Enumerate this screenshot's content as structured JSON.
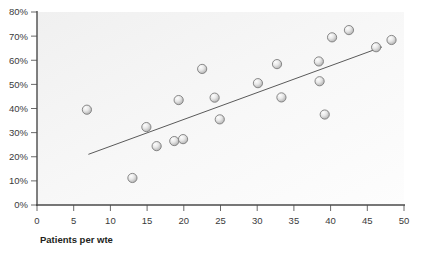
{
  "chart_data": {
    "type": "scatter",
    "title": "",
    "xlabel": "Patients per wte",
    "ylabel": "",
    "xlim": [
      0,
      50
    ],
    "ylim": [
      0,
      80
    ],
    "xticks": [
      0,
      5,
      10,
      15,
      20,
      25,
      30,
      35,
      40,
      45,
      50
    ],
    "xtick_labels": [
      "0",
      "5",
      "10",
      "15",
      "20",
      "25",
      "30",
      "35",
      "40",
      "45",
      "50"
    ],
    "yticks": [
      0,
      10,
      20,
      30,
      40,
      50,
      60,
      70,
      80
    ],
    "ytick_labels": [
      "0%",
      "10%",
      "20%",
      "30%",
      "40%",
      "50%",
      "60%",
      "70%",
      "80%"
    ],
    "grid": false,
    "legend": false,
    "points": [
      {
        "x": 6.8,
        "y": 39.5
      },
      {
        "x": 13.0,
        "y": 11.2
      },
      {
        "x": 14.9,
        "y": 32.3
      },
      {
        "x": 16.3,
        "y": 24.4
      },
      {
        "x": 18.7,
        "y": 26.5
      },
      {
        "x": 19.3,
        "y": 43.5
      },
      {
        "x": 19.9,
        "y": 27.3
      },
      {
        "x": 22.5,
        "y": 56.4
      },
      {
        "x": 24.2,
        "y": 44.5
      },
      {
        "x": 24.9,
        "y": 35.5
      },
      {
        "x": 30.1,
        "y": 50.5
      },
      {
        "x": 32.7,
        "y": 58.4
      },
      {
        "x": 33.3,
        "y": 44.6
      },
      {
        "x": 38.4,
        "y": 59.5
      },
      {
        "x": 38.5,
        "y": 51.3
      },
      {
        "x": 39.2,
        "y": 37.5
      },
      {
        "x": 40.2,
        "y": 69.5
      },
      {
        "x": 42.5,
        "y": 72.5
      },
      {
        "x": 46.2,
        "y": 65.4
      },
      {
        "x": 48.3,
        "y": 68.4
      }
    ],
    "trend_line": {
      "x_start": 7.0,
      "y_start": 21.0,
      "x_end": 47.0,
      "y_end": 65.5
    },
    "colors": {
      "marker_fill_light": "#f2f2f2",
      "marker_fill_dark": "#b9b9b9",
      "marker_stroke": "#7d7d7d",
      "axis": "#4a4a4a",
      "trend": "#5a5a5a",
      "tick_text": "#3b3b3b",
      "axis_title_text": "#231f20",
      "plot_background": "#f7f7f7",
      "page_background": "#ffffff"
    }
  }
}
